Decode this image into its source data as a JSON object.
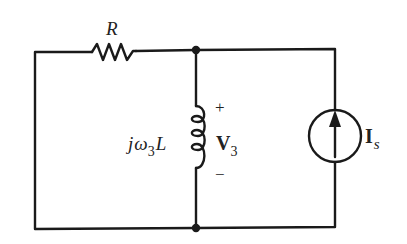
{
  "diagram": {
    "type": "circuit",
    "components": {
      "resistor": {
        "label": "R"
      },
      "inductor": {
        "label_j": "j",
        "label_omega": "ω",
        "label_sub": "3",
        "label_L": "L"
      },
      "voltage": {
        "plus": "+",
        "label": "V",
        "sub": "3",
        "minus": "−"
      },
      "current_source": {
        "label": "I",
        "sub": "s",
        "direction": "up"
      }
    },
    "colors": {
      "wire": "#1a1a1a",
      "text": "#222222",
      "background": "#ffffff"
    }
  }
}
